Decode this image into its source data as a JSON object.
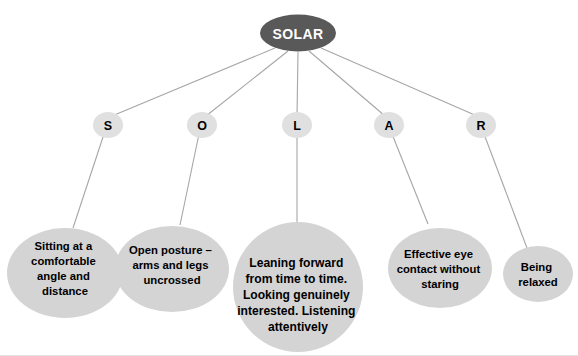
{
  "diagram": {
    "title": "SOLAR",
    "type": "mind-map",
    "colors": {
      "root_fill": "#595959",
      "root_text": "#ffffff",
      "letter_fill": "#e0e0e0",
      "leaf_fill": "#d4d4d4",
      "connector": "#a6a6a6",
      "text": "#000000",
      "background": "#ffffff"
    },
    "root": {
      "label": "SOLAR"
    },
    "branches": [
      {
        "letter": "S",
        "lines": [
          "Sitting at a",
          "comfortable",
          "angle and",
          "distance"
        ]
      },
      {
        "letter": "O",
        "lines": [
          "Open posture –",
          "arms and legs",
          "uncrossed"
        ]
      },
      {
        "letter": "L",
        "lines": [
          "Leaning forward",
          "from time to time.",
          "Looking genuinely",
          "interested. Listening",
          "attentively"
        ]
      },
      {
        "letter": "A",
        "lines": [
          "Effective eye",
          "contact without",
          "staring"
        ]
      },
      {
        "letter": "R",
        "lines": [
          "Being",
          "relaxed"
        ]
      }
    ]
  }
}
